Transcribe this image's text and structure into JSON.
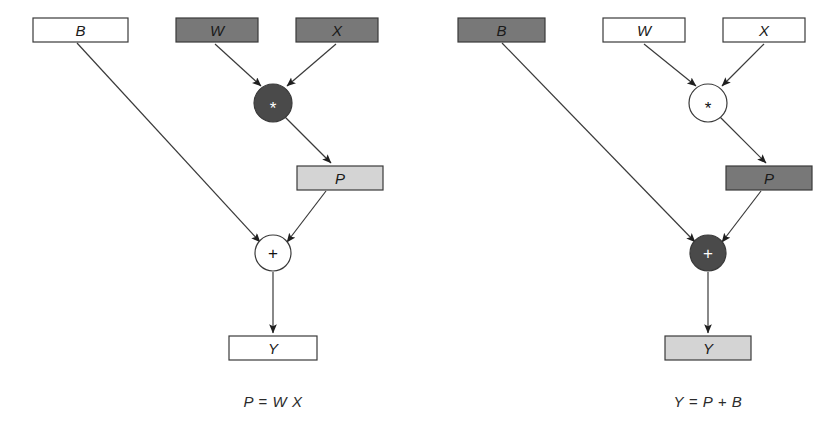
{
  "figure": {
    "type": "computation-graph",
    "background": "#ffffff",
    "panels": [
      {
        "id": "left",
        "caption": "P = W X",
        "caption_x": 273,
        "caption_y": 401,
        "nodes": [
          {
            "id": "b",
            "label": "B",
            "shape": "rect",
            "fill": "#ffffff",
            "text_color": "#1a1a1a",
            "x": 33,
            "y": 18,
            "w": 95,
            "h": 24
          },
          {
            "id": "w",
            "label": "W",
            "shape": "rect",
            "fill": "#787878",
            "text_color": "#111111",
            "x": 176,
            "y": 18,
            "w": 82,
            "h": 24
          },
          {
            "id": "x",
            "label": "X",
            "shape": "rect",
            "fill": "#787878",
            "text_color": "#111111",
            "x": 296,
            "y": 18,
            "w": 82,
            "h": 24
          },
          {
            "id": "mul",
            "label": "*",
            "shape": "circle",
            "fill": "#4a4a4a",
            "text_color": "#ffffff",
            "cx": 273,
            "cy": 103,
            "r": 19
          },
          {
            "id": "p",
            "label": "P",
            "shape": "rect",
            "fill": "#d4d4d4",
            "text_color": "#1a1a1a",
            "x": 297,
            "y": 166,
            "w": 86,
            "h": 24
          },
          {
            "id": "add",
            "label": "+",
            "shape": "circle",
            "fill": "#ffffff",
            "text_color": "#111111",
            "cx": 273,
            "cy": 253,
            "r": 18
          },
          {
            "id": "y",
            "label": "Y",
            "shape": "rect",
            "fill": "#ffffff",
            "text_color": "#1a1a1a",
            "x": 229,
            "y": 336,
            "w": 88,
            "h": 24
          }
        ],
        "edges": [
          {
            "from": "w",
            "to": "mul",
            "x1": 215,
            "y1": 44,
            "x2": 261,
            "y2": 86
          },
          {
            "from": "x",
            "to": "mul",
            "x1": 336,
            "y1": 44,
            "x2": 287,
            "y2": 86
          },
          {
            "from": "mul",
            "to": "p",
            "x1": 285,
            "y1": 117,
            "x2": 331,
            "y2": 163
          },
          {
            "from": "b",
            "to": "add",
            "x1": 77,
            "y1": 43,
            "x2": 260,
            "y2": 242
          },
          {
            "from": "p",
            "to": "add",
            "x1": 326,
            "y1": 191,
            "x2": 287,
            "y2": 242
          },
          {
            "from": "add",
            "to": "y",
            "x1": 273,
            "y1": 272,
            "x2": 273,
            "y2": 333
          }
        ]
      },
      {
        "id": "right",
        "caption": "Y = P + B",
        "caption_x": 708,
        "caption_y": 401,
        "nodes": [
          {
            "id": "b",
            "label": "B",
            "shape": "rect",
            "fill": "#787878",
            "text_color": "#111111",
            "x": 458,
            "y": 18,
            "w": 87,
            "h": 24
          },
          {
            "id": "w",
            "label": "W",
            "shape": "rect",
            "fill": "#ffffff",
            "text_color": "#1a1a1a",
            "x": 603,
            "y": 18,
            "w": 82,
            "h": 24
          },
          {
            "id": "x",
            "label": "X",
            "shape": "rect",
            "fill": "#ffffff",
            "text_color": "#1a1a1a",
            "x": 723,
            "y": 18,
            "w": 82,
            "h": 24
          },
          {
            "id": "mul",
            "label": "*",
            "shape": "circle",
            "fill": "#ffffff",
            "text_color": "#111111",
            "cx": 708,
            "cy": 103,
            "r": 19
          },
          {
            "id": "p",
            "label": "P",
            "shape": "rect",
            "fill": "#787878",
            "text_color": "#111111",
            "x": 726,
            "y": 166,
            "w": 86,
            "h": 24
          },
          {
            "id": "add",
            "label": "+",
            "shape": "circle",
            "fill": "#4a4a4a",
            "text_color": "#ffffff",
            "cx": 708,
            "cy": 253,
            "r": 18
          },
          {
            "id": "y",
            "label": "Y",
            "shape": "rect",
            "fill": "#d4d4d4",
            "text_color": "#1a1a1a",
            "x": 665,
            "y": 336,
            "w": 86,
            "h": 24
          }
        ],
        "edges": [
          {
            "from": "w",
            "to": "mul",
            "x1": 644,
            "y1": 44,
            "x2": 696,
            "y2": 86
          },
          {
            "from": "x",
            "to": "mul",
            "x1": 764,
            "y1": 44,
            "x2": 722,
            "y2": 86
          },
          {
            "from": "mul",
            "to": "p",
            "x1": 720,
            "y1": 117,
            "x2": 766,
            "y2": 163
          },
          {
            "from": "b",
            "to": "add",
            "x1": 502,
            "y1": 43,
            "x2": 695,
            "y2": 242
          },
          {
            "from": "p",
            "to": "add",
            "x1": 761,
            "y1": 191,
            "x2": 722,
            "y2": 242
          },
          {
            "from": "add",
            "to": "y",
            "x1": 708,
            "y1": 272,
            "x2": 708,
            "y2": 333
          }
        ]
      }
    ],
    "colors": {
      "stroke": "#3a3a3a",
      "dark_fill": "#4a4a4a",
      "gray_fill": "#787878",
      "light_fill": "#d4d4d4",
      "white_fill": "#ffffff"
    }
  }
}
